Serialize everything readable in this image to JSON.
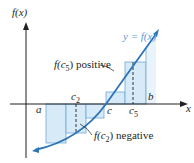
{
  "diagram": {
    "y_axis_label": "f(x)",
    "x_axis_label": "x",
    "curve_label": "y = f(x)",
    "points": {
      "a": "a",
      "b": "b",
      "c": "c",
      "c2": "c",
      "c2_sub": "2",
      "c5": "c",
      "c5_sub": "5"
    },
    "annotations": {
      "positive_prefix": "f(c",
      "positive_sub": "5",
      "positive_suffix": ") positive",
      "negative_prefix": "f(c",
      "negative_sub": "2",
      "negative_suffix": ") negative"
    },
    "colors": {
      "curve": "#2e75b6",
      "rect_fill": "#d6eaf8",
      "rect_stroke": "#6fa8d6",
      "axis": "#231f20",
      "curve_label": "#5b9bd5"
    },
    "rectangles": [
      {
        "x0": 46,
        "x1": 66,
        "height_sign": "negative"
      },
      {
        "x0": 66,
        "x1": 86,
        "height_sign": "negative"
      },
      {
        "x0": 86,
        "x1": 104,
        "height_sign": "negative"
      },
      {
        "x0": 106,
        "x1": 125,
        "height_sign": "positive"
      },
      {
        "x0": 125,
        "x1": 146,
        "height_sign": "positive"
      }
    ]
  }
}
